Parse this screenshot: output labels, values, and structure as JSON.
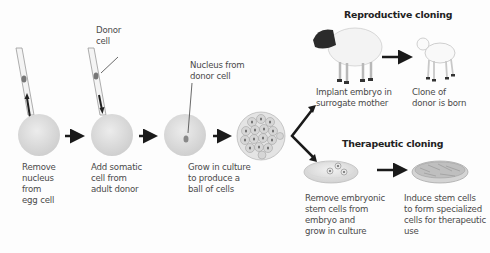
{
  "diagram": {
    "steps": [
      {
        "id": "remove-nucleus",
        "label": "Remove\nnucleus\nfrom\negg cell"
      },
      {
        "id": "add-somatic",
        "label": "Add somatic\ncell  from\nadult donor",
        "callout": "Donor\ncell"
      },
      {
        "id": "nucleus-from-donor",
        "label": "Grow in culture\nto produce a\nball of cells",
        "callout": "Nucleus from\ndonor cell"
      }
    ],
    "branches": {
      "reproductive": {
        "title": "Reproductive cloning",
        "steps": [
          {
            "label": "Implant embryo in\nsurrogate mother"
          },
          {
            "label": "Clone of\ndonor is born"
          }
        ]
      },
      "therapeutic": {
        "title": "Therapeutic cloning",
        "steps": [
          {
            "label": "Remove embryonic\nstem cells from\nembryo and\ngrow in culture"
          },
          {
            "label": "Induce stem cells\nto form specialized\ncells for therapeutic\nuse"
          }
        ]
      }
    },
    "colors": {
      "cell": "#dcdcdc",
      "arrow": "#1a1a1a",
      "text": "#4a4a4a",
      "title": "#222222"
    }
  }
}
